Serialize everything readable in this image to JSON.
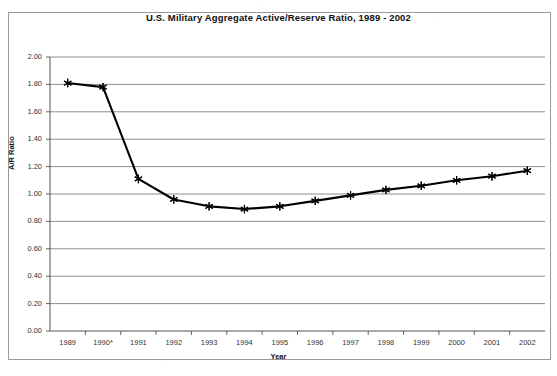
{
  "chart_data": {
    "type": "line",
    "title": "U.S. Military Aggregate Active/Reserve Ratio, 1989 - 2002",
    "xlabel": "Year",
    "ylabel": "A/R Ratio",
    "categories": [
      "1989",
      "1990*",
      "1991",
      "1992",
      "1993",
      "1994",
      "1995",
      "1996",
      "1997",
      "1998",
      "1999",
      "2000",
      "2001",
      "2002"
    ],
    "values": [
      1.81,
      1.78,
      1.11,
      0.96,
      0.91,
      0.89,
      0.91,
      0.95,
      0.99,
      1.03,
      1.06,
      1.1,
      1.13,
      1.17
    ],
    "ylim": [
      0.0,
      2.0
    ],
    "ytick_labels": [
      "0.00",
      "0.20",
      "0.40",
      "0.60",
      "0.80",
      "1.00",
      "1.20",
      "1.40",
      "1.60",
      "1.80",
      "2.00"
    ],
    "ytick_values": [
      0.0,
      0.2,
      0.4,
      0.6,
      0.8,
      1.0,
      1.2,
      1.4,
      1.6,
      1.8,
      2.0
    ],
    "grid": "horizontal",
    "legend": null,
    "marker": "asterisk",
    "series_color": "#000000",
    "gridline_color": "#808080",
    "footnote_marker": "*"
  }
}
